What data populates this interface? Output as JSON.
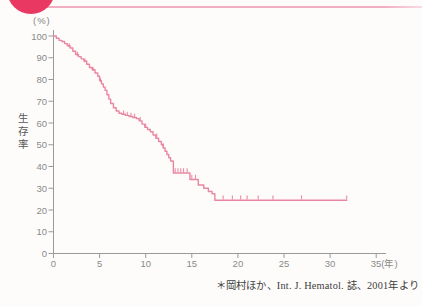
{
  "page": {
    "background": "#fdfcfa"
  },
  "decor": {
    "corner_badge_color": "#e93862",
    "header_rule_color": "#f2aec1",
    "header_rule_tip_color": "#f9dbe5"
  },
  "chart_data": {
    "type": "line",
    "subtype": "kaplan-meier-step",
    "title": "",
    "ylabel": "生存率",
    "y_unit_label": "(%)",
    "xlabel": "",
    "x_ticks": [
      0,
      5,
      10,
      15,
      20,
      25,
      30,
      35
    ],
    "x_tick_labels": [
      "0",
      "5",
      "10",
      "15",
      "20",
      "25",
      "30",
      "35(年)"
    ],
    "y_ticks": [
      0,
      10,
      20,
      30,
      40,
      50,
      60,
      70,
      80,
      90,
      100
    ],
    "xlim": [
      0,
      35
    ],
    "ylim": [
      0,
      100
    ],
    "grid": false,
    "legend": "none",
    "line_color": "#e8809c",
    "axis_color": "#9a9a9a",
    "tick_label_color": "#8a8a8a",
    "series_name": "生存率(%)",
    "points": [
      [
        0,
        100
      ],
      [
        0.3,
        99
      ],
      [
        0.6,
        98
      ],
      [
        0.9,
        97.5
      ],
      [
        1.2,
        96.5
      ],
      [
        1.5,
        95.5
      ],
      [
        1.8,
        94.5
      ],
      [
        2.1,
        93
      ],
      [
        2.4,
        91.5
      ],
      [
        2.7,
        90.5
      ],
      [
        3.0,
        89.5
      ],
      [
        3.3,
        88.5
      ],
      [
        3.6,
        87
      ],
      [
        3.9,
        85.5
      ],
      [
        4.2,
        84.5
      ],
      [
        4.5,
        83
      ],
      [
        4.8,
        81.5
      ],
      [
        5.0,
        79.5
      ],
      [
        5.2,
        78
      ],
      [
        5.4,
        76.5
      ],
      [
        5.6,
        75
      ],
      [
        5.8,
        73
      ],
      [
        6.0,
        71
      ],
      [
        6.2,
        69
      ],
      [
        6.5,
        67
      ],
      [
        6.8,
        65.5
      ],
      [
        7.1,
        64.5
      ],
      [
        7.4,
        64
      ],
      [
        7.8,
        63.5
      ],
      [
        8.2,
        63
      ],
      [
        8.6,
        62.5
      ],
      [
        9.0,
        62
      ],
      [
        9.3,
        61
      ],
      [
        9.6,
        59.5
      ],
      [
        9.9,
        58
      ],
      [
        10.2,
        57
      ],
      [
        10.5,
        56
      ],
      [
        10.8,
        54.5
      ],
      [
        11.1,
        53
      ],
      [
        11.4,
        51.5
      ],
      [
        11.7,
        50
      ],
      [
        11.9,
        48.5
      ],
      [
        12.1,
        47
      ],
      [
        12.3,
        45.5
      ],
      [
        12.5,
        44
      ],
      [
        12.7,
        42.5
      ],
      [
        13.0,
        37
      ],
      [
        14.8,
        34
      ],
      [
        15.7,
        31.5
      ],
      [
        16.3,
        30
      ],
      [
        16.8,
        28.5
      ],
      [
        17.2,
        27.5
      ],
      [
        17.5,
        24.5
      ],
      [
        31.8,
        24.5
      ]
    ],
    "censor_marks": [
      [
        1.7,
        94.5
      ],
      [
        2.6,
        90.5
      ],
      [
        3.4,
        87.5
      ],
      [
        4.3,
        83.5
      ],
      [
        5.1,
        78.5
      ],
      [
        7.6,
        63.5
      ],
      [
        8.0,
        63
      ],
      [
        8.4,
        62.5
      ],
      [
        8.8,
        62
      ],
      [
        9.4,
        60.5
      ],
      [
        10.0,
        57.5
      ],
      [
        11.2,
        53
      ],
      [
        11.9,
        48.5
      ],
      [
        13.2,
        37
      ],
      [
        13.5,
        37
      ],
      [
        13.8,
        37
      ],
      [
        14.1,
        37
      ],
      [
        14.5,
        37
      ],
      [
        15.0,
        34
      ],
      [
        15.4,
        34
      ],
      [
        18.4,
        24.5
      ],
      [
        19.4,
        24.5
      ],
      [
        20.3,
        24.5
      ],
      [
        21.0,
        24.5
      ],
      [
        22.2,
        24.5
      ],
      [
        23.8,
        24.5
      ],
      [
        26.9,
        24.5
      ],
      [
        31.8,
        24.5
      ]
    ],
    "source_note": "＊岡村ほか、Int. J. Hematol. 誌、2001年より"
  }
}
